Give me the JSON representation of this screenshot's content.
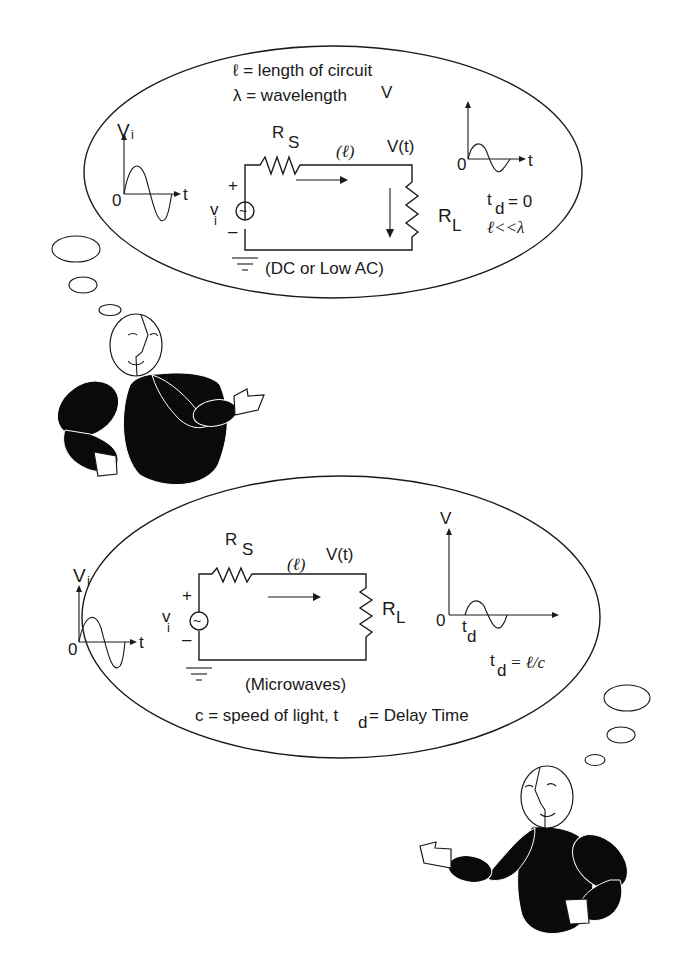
{
  "colors": {
    "ink": "#1a1a1a",
    "background": "#ffffff",
    "body": "#0a0a0a"
  },
  "top_bubble": {
    "legend_line1": "ℓ = length of circuit",
    "legend_line2": "λ = wavelength",
    "input_plot": {
      "y_label": "V",
      "y_sub": "i",
      "origin": "0",
      "x_label": "t"
    },
    "circuit": {
      "rs_label": "R",
      "rs_sub": "S",
      "length_label": "(ℓ)",
      "vt_label": "V(t)",
      "plus": "+",
      "minus": "–",
      "source_label": "v",
      "source_sub": "i",
      "source_symbol": "~",
      "rl_label": "R",
      "rl_sub": "L",
      "caption": "(DC or Low AC)"
    },
    "output_plot": {
      "y_label": "V",
      "origin": "0",
      "x_label": "t"
    },
    "delay": {
      "t": "t",
      "sub": "d",
      "rest": "= 0"
    },
    "condition": "ℓ<<λ"
  },
  "bottom_bubble": {
    "input_plot": {
      "y_label": "V",
      "y_sub": "i",
      "origin": "0",
      "x_label": "t"
    },
    "circuit": {
      "rs_label": "R",
      "rs_sub": "S",
      "length_label": "(ℓ)",
      "vt_label": "V(t)",
      "plus": "+",
      "minus": "–",
      "source_label": "v",
      "source_sub": "i",
      "source_symbol": "~",
      "rl_label": "R",
      "rl_sub": "L",
      "caption": "(Microwaves)"
    },
    "output_plot": {
      "y_label": "V",
      "origin": "0",
      "td_t": "t",
      "td_sub": "d"
    },
    "delay": {
      "t": "t",
      "sub": "d",
      "rest": "= ℓ/c"
    },
    "footer": {
      "part1": "c = speed of light, t",
      "sub": "d",
      "part2": " = Delay Time"
    }
  }
}
